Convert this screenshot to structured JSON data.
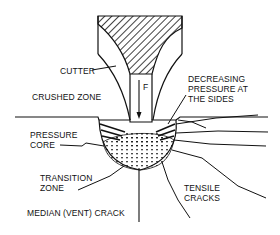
{
  "diagram": {
    "type": "cross-section",
    "labels": {
      "cutter": "CUTTER",
      "force": "F",
      "crushed_zone": "CRUSHED ZONE",
      "decreasing_pressure_1": "DECREASING",
      "decreasing_pressure_2": "PRESSURE AT",
      "decreasing_pressure_3": "THE SIDES",
      "pressure_core_1": "PRESSURE",
      "pressure_core_2": "CORE",
      "transition_zone_1": "TRANSITION",
      "transition_zone_2": "ZONE",
      "tensile_cracks_1": "TENSILE",
      "tensile_cracks_2": "CRACKS",
      "median_crack": "MEDIAN (VENT) CRACK"
    },
    "colors": {
      "line": "#111111",
      "background": "#ffffff"
    }
  }
}
